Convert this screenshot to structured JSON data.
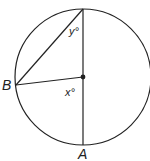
{
  "diagram": {
    "colors": {
      "stroke": "#222222",
      "background": "#ffffff"
    },
    "points": {
      "A": "A",
      "B": "B"
    },
    "angles": {
      "y": "y°",
      "x": "x°"
    }
  }
}
